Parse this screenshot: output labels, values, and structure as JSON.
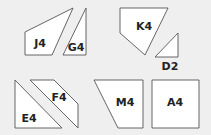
{
  "background": "#efefef",
  "shape_fill": "#ffffff",
  "stroke_color": "#555555",
  "pieces": [
    {
      "id": "J4",
      "label": "J4",
      "points": "25,32 73,8 52,55 25,55",
      "label_x": 40,
      "label_y": 47
    },
    {
      "id": "G4",
      "label": "G4",
      "points": "86,8 63,55 86,55",
      "label_x": 76,
      "label_y": 51
    },
    {
      "id": "K4",
      "label": "K4",
      "points": "120,8 168,8 145,55 120,33",
      "label_x": 144,
      "label_y": 30
    },
    {
      "id": "D2",
      "label": "D2",
      "points": "178,33 155,57 178,57",
      "label_x": 170,
      "label_y": 70
    },
    {
      "id": "E4",
      "label": "E4",
      "points": "15,80 62,128 15,128",
      "label_x": 29,
      "label_y": 122
    },
    {
      "id": "F4",
      "label": "F4",
      "points": "30,80 54,80 78,104 78,128",
      "label_x": 59,
      "label_y": 101
    },
    {
      "id": "M4",
      "label": "M4",
      "points": "94,80 143,80 143,128 118,128",
      "label_x": 125,
      "label_y": 106
    },
    {
      "id": "A4",
      "label": "A4",
      "points": "152,80 199,80 199,128 152,128",
      "label_x": 175,
      "label_y": 106
    }
  ]
}
